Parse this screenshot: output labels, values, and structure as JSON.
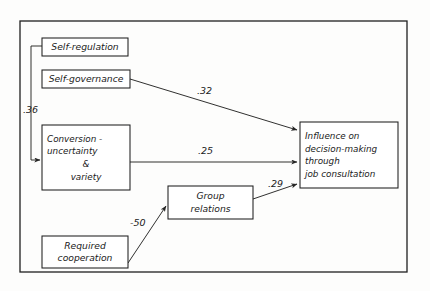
{
  "diagram": {
    "frame": {
      "x": 20,
      "y": 21,
      "width": 387,
      "height": 251
    },
    "colors": {
      "background": "#fdfdfc",
      "stroke": "#20201f",
      "text": "#1a1a1a",
      "box_fill": "#ffffff"
    },
    "nodes": [
      {
        "id": "self-regulation",
        "label": "Self-regulation",
        "lines": [
          "Self-regulation"
        ],
        "x": 42,
        "y": 38,
        "width": 86,
        "height": 18
      },
      {
        "id": "self-governance",
        "label": "Self-governance",
        "lines": [
          "Self-governance"
        ],
        "x": 42,
        "y": 70,
        "width": 88,
        "height": 18
      },
      {
        "id": "conversion",
        "label": "Conversion - uncertainty & variety",
        "lines": [
          "Conversion -",
          "uncertainty",
          "&",
          "variety"
        ],
        "x": 42,
        "y": 125,
        "width": 88,
        "height": 65
      },
      {
        "id": "group-relations",
        "label": "Group relations",
        "lines": [
          "Group",
          "relations"
        ],
        "x": 168,
        "y": 186,
        "width": 85,
        "height": 33
      },
      {
        "id": "required-cooperation",
        "label": "Required cooperation",
        "lines": [
          "Required",
          "cooperation"
        ],
        "x": 42,
        "y": 236,
        "width": 86,
        "height": 32
      },
      {
        "id": "influence",
        "label": "Influence on decision-making through job consultation",
        "lines": [
          "Influence on",
          "decision-making",
          "through",
          "job consultation"
        ],
        "x": 300,
        "y": 122,
        "width": 98,
        "height": 66
      }
    ],
    "edges": [
      {
        "id": "self-regulation-to-conversion",
        "from": "self-regulation",
        "to": "conversion",
        "label": ".36",
        "label_x": 23,
        "label_y": 113,
        "path": "M 42 46 L 31 46 L 31 160 L 40 160"
      },
      {
        "id": "self-governance-to-influence",
        "from": "self-governance",
        "to": "influence",
        "label": ".32",
        "label_x": 197,
        "label_y": 94,
        "path": "M 130 79 L 297 130"
      },
      {
        "id": "conversion-to-influence",
        "from": "conversion",
        "to": "influence",
        "label": ".25",
        "label_x": 198,
        "label_y": 154,
        "path": "M 130 162 L 297 162"
      },
      {
        "id": "required-cooperation-to-group-relations",
        "from": "required-cooperation",
        "to": "group-relations",
        "label": "-50",
        "label_x": 130,
        "label_y": 226,
        "path": "M 128 263 L 166 206"
      },
      {
        "id": "group-relations-to-influence",
        "from": "group-relations",
        "to": "influence",
        "label": ".29",
        "label_x": 268,
        "label_y": 187,
        "path": "M 253 199 L 297 184"
      }
    ]
  }
}
